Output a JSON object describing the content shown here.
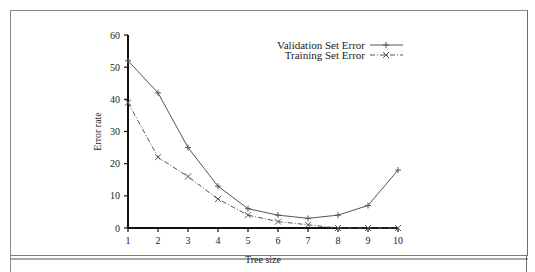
{
  "chart_data": {
    "type": "line",
    "title": "",
    "xlabel": "Tree size",
    "ylabel": "Error rate",
    "x": [
      1,
      2,
      3,
      4,
      5,
      6,
      7,
      8,
      9,
      10
    ],
    "categories": [
      "1",
      "2",
      "3",
      "4",
      "5",
      "6",
      "7",
      "8",
      "9",
      "10"
    ],
    "xlim": [
      1,
      10
    ],
    "ylim": [
      0,
      60
    ],
    "yticks": [
      0,
      10,
      20,
      30,
      40,
      50,
      60
    ],
    "xticks": [
      1,
      2,
      3,
      4,
      5,
      6,
      7,
      8,
      9,
      10
    ],
    "grid": false,
    "legend_position": "upper-right",
    "series": [
      {
        "name": "Validation Set Error",
        "marker": "+",
        "line_style": "solid",
        "values": [
          52,
          42,
          25,
          13,
          6,
          4,
          3,
          4,
          7,
          18
        ]
      },
      {
        "name": "Training Set Error",
        "marker": "x",
        "line_style": "dash-dot",
        "values": [
          39,
          22,
          16,
          9,
          4,
          2,
          1,
          0,
          0,
          0
        ]
      }
    ]
  },
  "colors": {
    "line": "#555555",
    "axis": "#111111",
    "frame": "#8a8a8a"
  }
}
